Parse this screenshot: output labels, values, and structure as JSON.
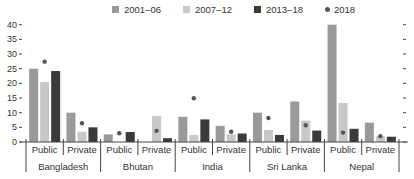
{
  "chart_data": {
    "type": "bar",
    "title": "",
    "xlabel": "",
    "ylabel": "",
    "ylim": [
      0,
      40
    ],
    "yticks": [
      0,
      5,
      10,
      15,
      20,
      25,
      30,
      35,
      40
    ],
    "grid": false,
    "legend_position": "top",
    "countries": [
      "Bangladesh",
      "Bhutan",
      "India",
      "Sri Lanka",
      "Nepal"
    ],
    "sectors": [
      "Public",
      "Private"
    ],
    "categories": [
      "Bangladesh Public",
      "Bangladesh Private",
      "Bhutan Public",
      "Bhutan Private",
      "India Public",
      "India Private",
      "Sri Lanka Public",
      "Sri Lanka Private",
      "Nepal Public",
      "Nepal Private"
    ],
    "series": [
      {
        "name": "2001–06",
        "kind": "bar",
        "color": "#9a9a9a",
        "values": [
          25,
          10,
          2.6,
          0,
          8.6,
          5.5,
          10,
          13.8,
          40,
          6.6
        ]
      },
      {
        "name": "2007–12",
        "kind": "bar",
        "color": "#c8c8c8",
        "values": [
          20.5,
          3.5,
          0,
          8.9,
          2.4,
          2.6,
          4.1,
          7.3,
          13.3,
          2
        ]
      },
      {
        "name": "2013–18",
        "kind": "bar",
        "color": "#3a3a3a",
        "values": [
          24.2,
          5,
          3.4,
          1.3,
          7.7,
          2.9,
          2.4,
          3.9,
          4.5,
          1.8
        ]
      },
      {
        "name": "2018",
        "kind": "dot",
        "color": "#555555",
        "values": [
          27.4,
          6.4,
          3,
          3.8,
          14.9,
          3.5,
          8.2,
          5.7,
          3.2,
          2
        ]
      }
    ]
  },
  "legend": [
    {
      "label": "2001–06",
      "color": "#9a9a9a",
      "shape": "square"
    },
    {
      "label": "2007–12",
      "color": "#c8c8c8",
      "shape": "square"
    },
    {
      "label": "2013–18",
      "color": "#3a3a3a",
      "shape": "square"
    },
    {
      "label": "2018",
      "color": "#555555",
      "shape": "dot"
    }
  ]
}
